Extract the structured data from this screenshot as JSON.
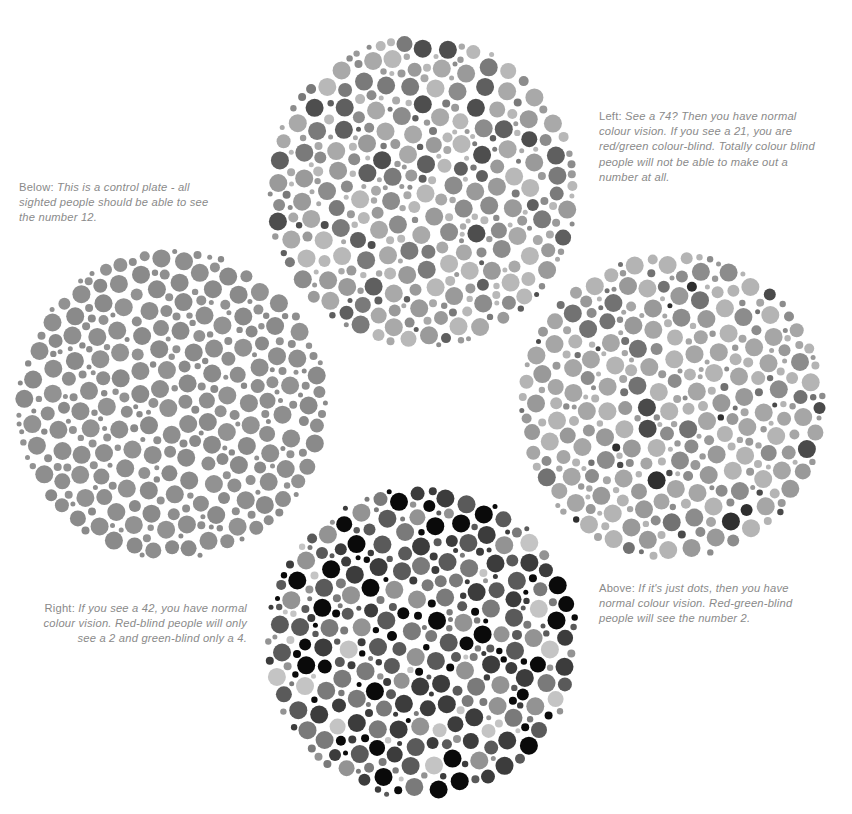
{
  "plates": [
    {
      "id": "top",
      "label": "Plate 74 / 21",
      "cx": 422,
      "cy": 192,
      "r": 157,
      "seed": 11,
      "palette": [
        "#b8b8b8",
        "#a9a9a9",
        "#9a9a9a",
        "#8c8c8c",
        "#7a7a7a",
        "#5f5f5f",
        "#4e4e4e"
      ],
      "weights": [
        22,
        20,
        16,
        14,
        12,
        9,
        5
      ]
    },
    {
      "id": "left",
      "label": "Control plate 12",
      "cx": 172,
      "cy": 405,
      "r": 157,
      "seed": 23,
      "palette": [
        "#8e8e8e",
        "#8a8a8a",
        "#929292"
      ],
      "weights": [
        40,
        30,
        30
      ]
    },
    {
      "id": "right",
      "label": "Hidden-digit plate 2",
      "cx": 672,
      "cy": 406,
      "r": 155,
      "seed": 37,
      "palette": [
        "#b4b4b4",
        "#a6a6a6",
        "#999999",
        "#8c8c8c",
        "#727272",
        "#4a4a4a",
        "#2f2f2f"
      ],
      "weights": [
        24,
        24,
        20,
        14,
        9,
        5,
        4
      ]
    },
    {
      "id": "bottom",
      "label": "Plate 42",
      "cx": 422,
      "cy": 643,
      "r": 158,
      "seed": 53,
      "palette": [
        "#0a0a0a",
        "#3c3c3c",
        "#5a5a5a",
        "#7a7a7a",
        "#939393",
        "#c4c4c4"
      ],
      "weights": [
        24,
        20,
        18,
        16,
        14,
        8
      ]
    }
  ],
  "captions": {
    "top": {
      "lead": "Left: ",
      "body": "See a 74? Then you have normal colour vision. If you see a 21, you are red/green colour-blind. Totally colour blind people will not be able to make out a number at all."
    },
    "left": {
      "lead": "Below: ",
      "body": "This is a control plate - all sighted people should be able to see the number 12."
    },
    "bottom": {
      "lead": "Right: ",
      "body": "If you see a 42, you have normal colour vision. Red-blind people will only see a 2 and green-blind only a 4."
    },
    "right": {
      "lead": "Above: ",
      "body": "If it's just dots, then you have normal colour vision. Red-green-blind people will see the number 2."
    }
  },
  "colors": {
    "background": "#ffffff",
    "caption_text": "#8a8a8a"
  }
}
